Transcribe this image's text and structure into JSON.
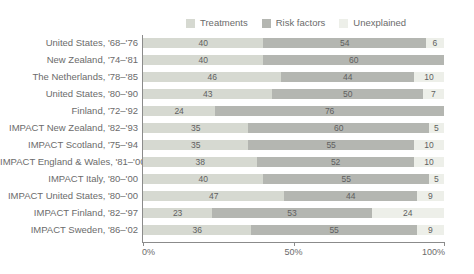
{
  "chart_data": {
    "type": "bar",
    "subtype": "horizontal-stacked-100",
    "title": "",
    "xlabel": "",
    "ylabel": "",
    "xlim": [
      0,
      100
    ],
    "xticks": [
      "0%",
      "50%",
      "100%"
    ],
    "xtick_values": [
      0,
      50,
      100
    ],
    "grid": false,
    "legend_position": "top-center",
    "categories": [
      "United States, '68–'76",
      "New Zealand, '74–'81",
      "The Netherlands, '78–'85",
      "United States, '80–'90",
      "Finland, '72–'92",
      "IMPACT New Zealand, '82–'93",
      "IMPACT Scotland, '75–'94",
      "IMPACT England & Wales, '81–'00",
      "IMPACT Italy, '80–'00",
      "IMPACT United States, '80–'00",
      "IMPACT Finland, '82–'97",
      "IMPACT Sweden, '86–'02"
    ],
    "series": [
      {
        "name": "Treatments",
        "color": "#d6d9d1",
        "values": [
          40,
          40,
          46,
          43,
          24,
          35,
          35,
          38,
          40,
          47,
          23,
          36
        ]
      },
      {
        "name": "Risk factors",
        "color": "#b4b6b1",
        "values": [
          54,
          60,
          44,
          50,
          76,
          60,
          55,
          52,
          55,
          44,
          53,
          55
        ]
      },
      {
        "name": "Unexplained",
        "color": "#edefe9",
        "values": [
          6,
          0,
          10,
          7,
          0,
          5,
          10,
          10,
          5,
          9,
          24,
          9
        ]
      }
    ],
    "value_labels": [
      [
        "40",
        "54",
        "6"
      ],
      [
        "40",
        "60",
        ""
      ],
      [
        "46",
        "44",
        "10"
      ],
      [
        "43",
        "50",
        "7"
      ],
      [
        "24",
        "76",
        ""
      ],
      [
        "35",
        "60",
        "5"
      ],
      [
        "35",
        "55",
        "10"
      ],
      [
        "38",
        "52",
        "10"
      ],
      [
        "40",
        "55",
        "5"
      ],
      [
        "47",
        "44",
        "9"
      ],
      [
        "23",
        "53",
        "24"
      ],
      [
        "36",
        "55",
        "9"
      ]
    ]
  },
  "legend": {
    "items": [
      {
        "label": "Treatments",
        "color": "#d6d9d1",
        "icon": "legend-swatch-icon"
      },
      {
        "label": "Risk factors",
        "color": "#b4b6b1",
        "icon": "legend-swatch-icon"
      },
      {
        "label": "Unexplained",
        "color": "#edefe9",
        "icon": "legend-swatch-icon"
      }
    ]
  },
  "axis": {
    "x_ticks": [
      "0%",
      "50%",
      "100%"
    ]
  },
  "colors": {
    "axis_line": "#8b8b8b",
    "text": "#6b6b6b",
    "value_text": "#5f5f5f",
    "background": "#ffffff"
  }
}
